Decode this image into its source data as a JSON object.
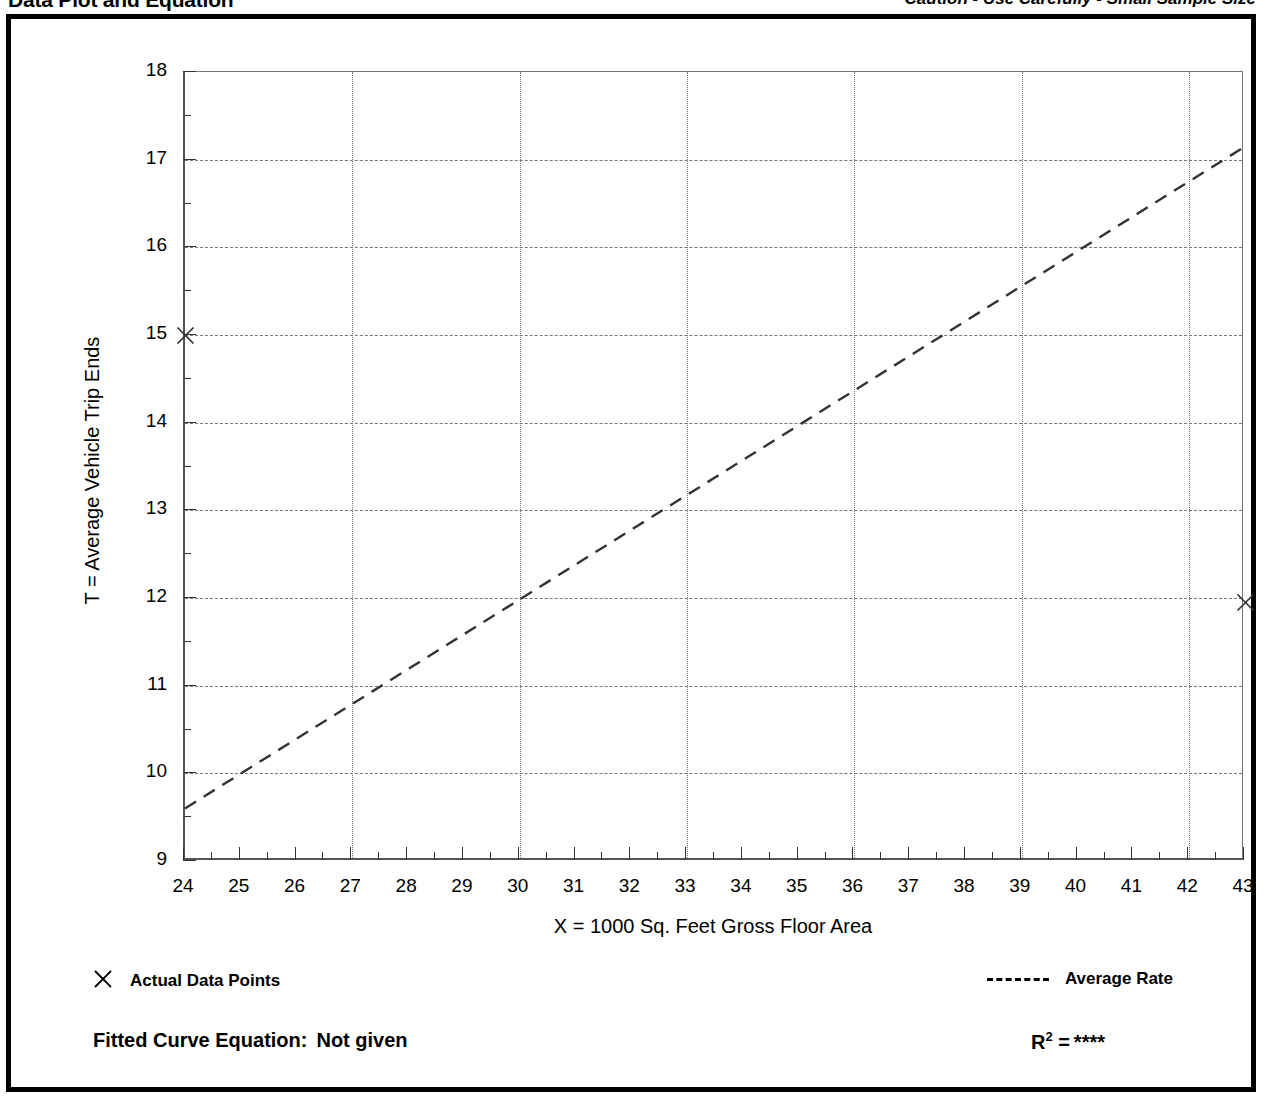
{
  "header": {
    "title": "Data Plot and Equation",
    "caution": "Caution - Use Carefully - Small Sample Size"
  },
  "legend": {
    "data_points_label": "Actual Data Points",
    "data_points_marker": "x-cross-icon",
    "average_rate_label": "Average Rate",
    "average_rate_marker": "dashed-line-icon"
  },
  "footer": {
    "equation_label": "Fitted Curve Equation:",
    "equation_value": "Not given",
    "r_squared_label": "R",
    "r_squared_exponent": "2",
    "r_squared_equals": "=",
    "r_squared_value": "****"
  },
  "chart_data": {
    "type": "scatter",
    "title": "Data Plot and Equation",
    "xlabel": "X = 1000 Sq. Feet Gross Floor Area",
    "ylabel": "T = Average Vehicle Trip Ends",
    "xlim": [
      24,
      43
    ],
    "ylim": [
      9,
      18
    ],
    "xticks": [
      24,
      25,
      26,
      27,
      28,
      29,
      30,
      31,
      32,
      33,
      34,
      35,
      36,
      37,
      38,
      39,
      40,
      41,
      42,
      43
    ],
    "xticklabels": [
      "24",
      "25",
      "26",
      "27",
      "28",
      "29",
      "30",
      "31",
      "32",
      "33",
      "34",
      "35",
      "36",
      "37",
      "38",
      "39",
      "40",
      "41",
      "42",
      "43"
    ],
    "yticks": [
      9,
      10,
      11,
      12,
      13,
      14,
      15,
      16,
      17,
      18
    ],
    "yticklabels": [
      "9",
      "10",
      "11",
      "12",
      "13",
      "14",
      "15",
      "16",
      "17",
      "18"
    ],
    "x_minor_tick_step": 0.5,
    "y_minor_tick_step": 0.5,
    "grid": true,
    "grid_vertical_at": [
      27,
      30,
      33,
      36,
      39,
      42
    ],
    "grid_horizontal_at": [
      10,
      11,
      12,
      13,
      14,
      15,
      16,
      17
    ],
    "legend_position": "below-plot",
    "series": [
      {
        "name": "Actual Data Points",
        "type": "scatter",
        "marker": "x",
        "points": [
          {
            "x": 24,
            "y": 15.0
          },
          {
            "x": 43,
            "y": 11.95
          }
        ]
      },
      {
        "name": "Average Rate",
        "type": "line",
        "style": "dashed",
        "points": [
          {
            "x": 24,
            "y": 9.6
          },
          {
            "x": 43,
            "y": 17.15
          }
        ]
      }
    ]
  }
}
